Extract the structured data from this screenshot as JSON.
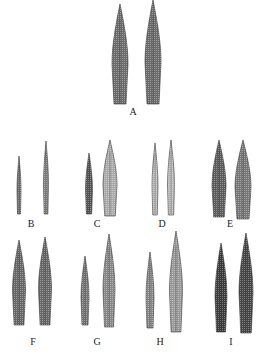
{
  "figure": {
    "panels": [
      {
        "label": "A",
        "label_x": 133,
        "label_y": 106,
        "leaves": [
          {
            "cx": 120,
            "top": 4,
            "bottom": 104,
            "width": 16,
            "shade": "#6a6a6a"
          },
          {
            "cx": 153,
            "top": 0,
            "bottom": 104,
            "width": 16,
            "shade": "#6a6a6a"
          }
        ]
      },
      {
        "label": "B",
        "label_x": 31,
        "label_y": 218,
        "leaves": [
          {
            "cx": 19,
            "top": 156,
            "bottom": 214,
            "width": 4,
            "shade": "#777"
          },
          {
            "cx": 46,
            "top": 141,
            "bottom": 214,
            "width": 5,
            "shade": "#888"
          }
        ]
      },
      {
        "label": "C",
        "label_x": 97,
        "label_y": 218,
        "leaves": [
          {
            "cx": 89,
            "top": 153,
            "bottom": 214,
            "width": 7,
            "shade": "#555"
          },
          {
            "cx": 110,
            "top": 140,
            "bottom": 216,
            "width": 14,
            "shade": "#aaa"
          }
        ]
      },
      {
        "label": "D",
        "label_x": 162,
        "label_y": 218,
        "leaves": [
          {
            "cx": 155,
            "top": 143,
            "bottom": 215,
            "width": 6,
            "shade": "#bbb"
          },
          {
            "cx": 171,
            "top": 140,
            "bottom": 215,
            "width": 7,
            "shade": "#bbb"
          }
        ]
      },
      {
        "label": "E",
        "label_x": 230,
        "label_y": 218,
        "leaves": [
          {
            "cx": 219,
            "top": 140,
            "bottom": 217,
            "width": 14,
            "shade": "#5a5a5a"
          },
          {
            "cx": 243,
            "top": 140,
            "bottom": 219,
            "width": 16,
            "shade": "#777"
          }
        ]
      },
      {
        "label": "F",
        "label_x": 33,
        "label_y": 336,
        "leaves": [
          {
            "cx": 19,
            "top": 240,
            "bottom": 325,
            "width": 13,
            "shade": "#666"
          },
          {
            "cx": 45,
            "top": 237,
            "bottom": 325,
            "width": 13,
            "shade": "#666"
          }
        ]
      },
      {
        "label": "G",
        "label_x": 97,
        "label_y": 336,
        "leaves": [
          {
            "cx": 85,
            "top": 256,
            "bottom": 325,
            "width": 8,
            "shade": "#777"
          },
          {
            "cx": 109,
            "top": 234,
            "bottom": 327,
            "width": 12,
            "shade": "#888"
          }
        ]
      },
      {
        "label": "H",
        "label_x": 160,
        "label_y": 336,
        "leaves": [
          {
            "cx": 150,
            "top": 252,
            "bottom": 328,
            "width": 8,
            "shade": "#888"
          },
          {
            "cx": 176,
            "top": 231,
            "bottom": 332,
            "width": 13,
            "shade": "#999"
          }
        ]
      },
      {
        "label": "I",
        "label_x": 231,
        "label_y": 336,
        "leaves": [
          {
            "cx": 221,
            "top": 243,
            "bottom": 332,
            "width": 12,
            "shade": "#3a3a3a"
          },
          {
            "cx": 246,
            "top": 233,
            "bottom": 333,
            "width": 14,
            "shade": "#444"
          }
        ]
      }
    ]
  }
}
